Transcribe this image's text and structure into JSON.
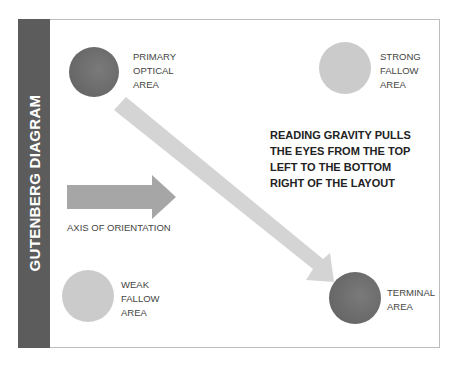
{
  "title": "GUTENBERG DIAGRAM",
  "areas": {
    "primary": {
      "lines": [
        "PRIMARY",
        "OPTICAL",
        "AREA"
      ],
      "shade": "dark"
    },
    "strong": {
      "lines": [
        "STRONG",
        "FALLOW",
        "AREA"
      ],
      "shade": "light"
    },
    "weak": {
      "lines": [
        "WEAK",
        "FALLOW",
        "AREA"
      ],
      "shade": "light"
    },
    "terminal": {
      "lines": [
        "TERMINAL",
        "AREA"
      ],
      "shade": "dark"
    }
  },
  "axis_label": "AXIS OF ORIENTATION",
  "gravity_text": {
    "lines": [
      "READING GRAVITY PULLS",
      "THE EYES FROM THE TOP",
      "LEFT TO THE BOTTOM",
      "RIGHT OF THE LAYOUT"
    ]
  },
  "colors": {
    "sidebar": "#5c5c5c",
    "dark_circle": "#6a6a6a",
    "light_circle": "#cbcbcb",
    "horizontal_arrow": "#a6a6a6",
    "diagonal_arrow": "#d4d4d4"
  }
}
